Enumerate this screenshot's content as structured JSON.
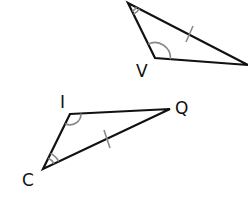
{
  "diagram": {
    "type": "congruent-triangles",
    "colors": {
      "line": "#111111",
      "mark": "#888888",
      "background": "#ffffff"
    },
    "triangles": [
      {
        "name": "top-triangle",
        "vertices": {
          "top": {
            "x": 128,
            "y": 3,
            "label": ""
          },
          "V": {
            "x": 155,
            "y": 58,
            "label": "V"
          },
          "right": {
            "x": 248,
            "y": 65,
            "label": ""
          }
        },
        "angle_marks": [
          {
            "vertex": "top",
            "arcs": 2
          },
          {
            "vertex": "V",
            "arcs": 1
          }
        ],
        "tick_marks": [
          {
            "side": "top-right",
            "ticks": 1
          }
        ]
      },
      {
        "name": "bottom-triangle",
        "vertices": {
          "I": {
            "x": 70,
            "y": 114,
            "label": "I"
          },
          "Q": {
            "x": 170,
            "y": 109,
            "label": "Q"
          },
          "C": {
            "x": 43,
            "y": 169,
            "label": "C"
          }
        },
        "angle_marks": [
          {
            "vertex": "I",
            "arcs": 1
          },
          {
            "vertex": "C",
            "arcs": 2
          }
        ],
        "tick_marks": [
          {
            "side": "C-Q",
            "ticks": 1
          }
        ]
      }
    ],
    "labels": {
      "V": "V",
      "I": "I",
      "Q": "Q",
      "C": "C"
    }
  }
}
